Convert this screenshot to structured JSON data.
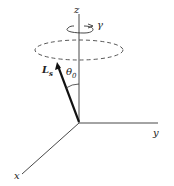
{
  "diagram": {
    "axes": {
      "z": "z",
      "y": "y",
      "x": "x"
    },
    "rotation_label": "γ",
    "vector": {
      "name": "L",
      "subscript": "s"
    },
    "angle": {
      "symbol": "θ",
      "subscript": "0"
    }
  }
}
